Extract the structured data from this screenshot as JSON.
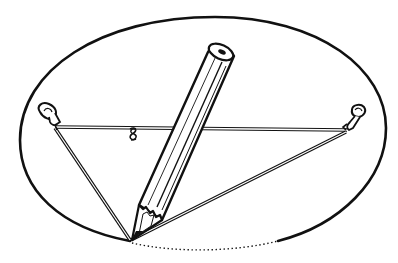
{
  "figure": {
    "colors": {
      "ink": "#111111",
      "background": "#ffffff",
      "string_fill": "#ffffff"
    },
    "ellipse": {
      "cx": 204,
      "cy": 134,
      "rx": 184,
      "ry": 117,
      "drawn_part": "solid",
      "remaining_part": "dotted"
    },
    "pins": [
      {
        "name": "left-pin",
        "x": 55,
        "y": 127
      },
      {
        "name": "right-pin",
        "x": 347,
        "y": 130
      }
    ],
    "pencil": {
      "tip_x": 130,
      "tip_y": 241,
      "top_x": 222,
      "top_y": 52
    },
    "string": {
      "knot_x": 133,
      "knot_y": 133
    }
  }
}
